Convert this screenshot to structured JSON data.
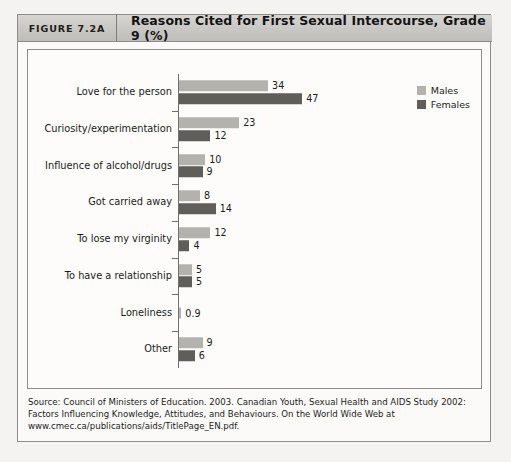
{
  "figure": {
    "number_label": "FIGURE 7.2A",
    "title": "Reasons Cited for First Sexual Intercourse, Grade 9 (%)",
    "source_note": "Source: Council of Ministers of Education. 2003. Canadian Youth, Sexual Health and AIDS Study 2002: Factors Influencing Knowledge, Attitudes, and Behaviours. On the World Wide Web at www.cmec.ca/publications/aids/TitlePage_EN.pdf."
  },
  "colors": {
    "males": "#b4b2ad",
    "females": "#5f5e5b",
    "header_band": "#cbc9c5",
    "frame": "#8d8c88",
    "panel_background": "#fdfcfa",
    "page_background": "#f4f3f1"
  },
  "chart_data": {
    "type": "bar",
    "orientation": "horizontal",
    "title": "Reasons Cited for First Sexual Intercourse, Grade 9 (%)",
    "xlabel": "",
    "ylabel": "",
    "xlim": [
      0,
      50
    ],
    "grid": false,
    "legend_position": "top-right",
    "categories": [
      "Love for the person",
      "Curiosity/experimentation",
      "Influence of alcohol/drugs",
      "Got carried away",
      "To lose my virginity",
      "To have a relationship",
      "Loneliness",
      "Other"
    ],
    "series": [
      {
        "name": "Males",
        "color": "#b4b2ad",
        "values": [
          34,
          23,
          10,
          8,
          12,
          5,
          0.9,
          9
        ],
        "labels": [
          "34",
          "23",
          "10",
          "8",
          "12",
          "5",
          "0.9",
          "9"
        ]
      },
      {
        "name": "Females",
        "color": "#5f5e5b",
        "values": [
          47,
          12,
          9,
          14,
          4,
          5,
          null,
          6
        ],
        "labels": [
          "47",
          "12",
          "9",
          "14",
          "4",
          "5",
          "",
          "6"
        ]
      }
    ]
  },
  "legend": {
    "items": [
      {
        "label": "Males",
        "color": "#b4b2ad"
      },
      {
        "label": "Females",
        "color": "#5f5e5b"
      }
    ]
  }
}
